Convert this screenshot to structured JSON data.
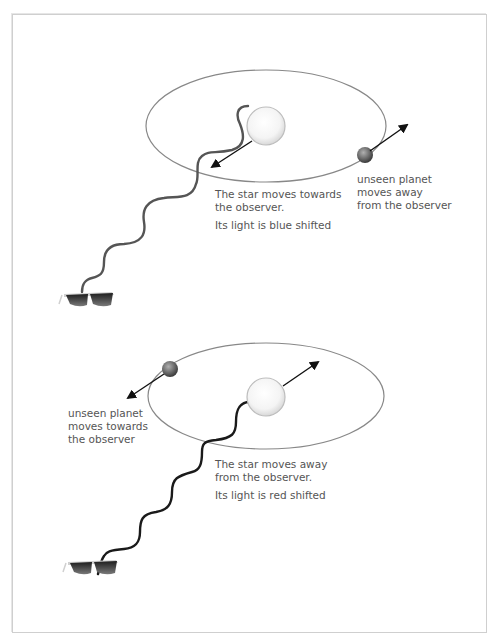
{
  "panels": [
    {
      "id": "blue-shift",
      "star_caption": {
        "line1": "The star moves towards",
        "line2": "the observer.",
        "line3": "Its light is blue shifted"
      },
      "planet_caption": {
        "line1": "unseen planet",
        "line2": "moves away",
        "line3": "from the observer"
      },
      "wave_color": "#555555"
    },
    {
      "id": "red-shift",
      "star_caption": {
        "line1": "The star moves away",
        "line2": "from the observer.",
        "line3": "Its light is red shifted"
      },
      "planet_caption": {
        "line1": "unseen planet",
        "line2": "moves towards",
        "line3": "the observer"
      },
      "wave_color": "#1a1a1a"
    }
  ],
  "icons": {
    "observer": "sunglasses-icon",
    "star": "star-sphere-icon",
    "planet": "planet-sphere-icon"
  }
}
